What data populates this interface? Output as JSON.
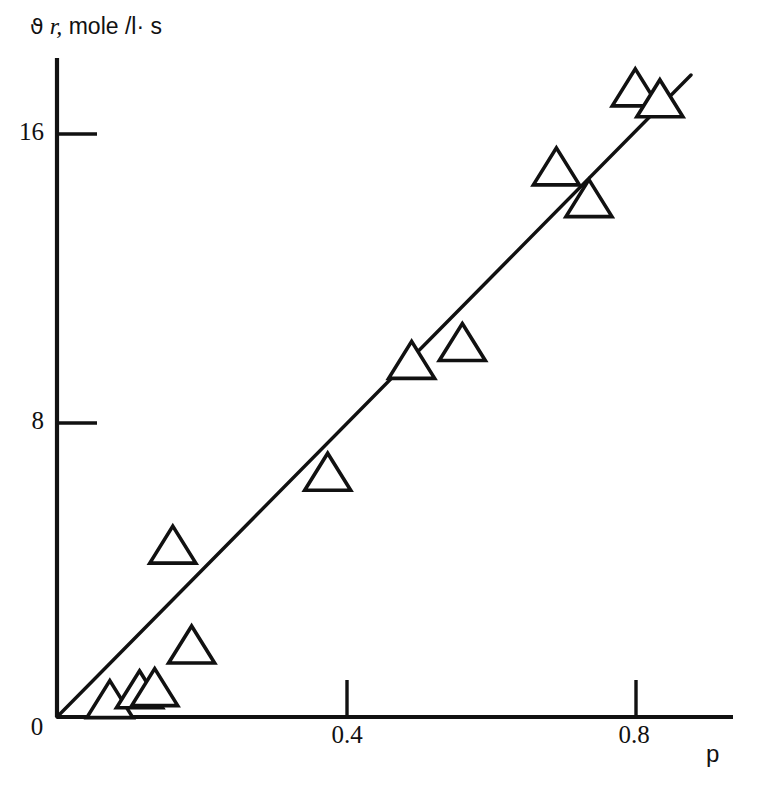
{
  "chart_data": {
    "type": "scatter",
    "title": "",
    "subtitle": "",
    "ylabel": "ϑ r, mole /l·s",
    "ylabel_parts": {
      "theta": "ϑ",
      "rate": "r,",
      "units": "mole /l· s"
    },
    "xlabel": "p",
    "origin_label": "0",
    "xticks": [
      0.4,
      0.8
    ],
    "xtick_labels": [
      "0.4",
      "0.8"
    ],
    "yticks": [
      8,
      16
    ],
    "ytick_labels": [
      "8",
      "16"
    ],
    "xlim": [
      0,
      0.932
    ],
    "ylim": [
      0,
      18.05
    ],
    "grid": false,
    "legend": null,
    "marker": "open-triangle-up",
    "x": [
      0.073,
      0.114,
      0.135,
      0.16,
      0.186,
      0.374,
      0.49,
      0.56,
      0.69,
      0.735,
      0.799,
      0.833
    ],
    "y": [
      0.47,
      0.74,
      0.8,
      4.71,
      1.97,
      6.71,
      9.78,
      10.27,
      15.09,
      14.22,
      17.26,
      16.96
    ],
    "points": [
      {
        "x": 0.073,
        "y": 0.47
      },
      {
        "x": 0.114,
        "y": 0.74
      },
      {
        "x": 0.135,
        "y": 0.8
      },
      {
        "x": 0.16,
        "y": 4.71
      },
      {
        "x": 0.186,
        "y": 1.97
      },
      {
        "x": 0.374,
        "y": 6.71
      },
      {
        "x": 0.49,
        "y": 9.78
      },
      {
        "x": 0.56,
        "y": 10.27
      },
      {
        "x": 0.69,
        "y": 15.09
      },
      {
        "x": 0.735,
        "y": 14.22
      },
      {
        "x": 0.799,
        "y": 17.26
      },
      {
        "x": 0.833,
        "y": 16.96
      }
    ],
    "fit_line": {
      "type": "line",
      "x": [
        0.0,
        0.876
      ],
      "y": [
        0.0,
        17.62
      ],
      "slope": 20.1,
      "intercept": 0.0
    },
    "colors": {
      "axis": "#111111",
      "marker_stroke": "#111111",
      "marker_fill": "#ffffff",
      "line": "#111111",
      "background": "#ffffff"
    }
  }
}
